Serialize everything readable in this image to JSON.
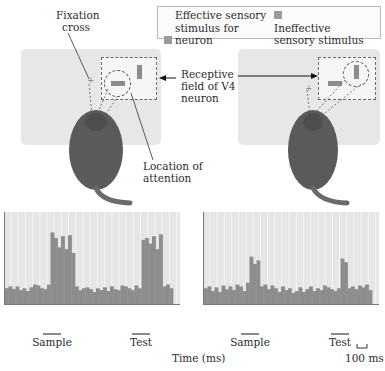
{
  "chart_data": [
    {
      "type": "bar",
      "title": "Attention directed to effective stimulus (in receptive field)",
      "xlabel": "Time (ms)",
      "ylabel": "",
      "scale_bar": "100 ms",
      "grid": true,
      "events": [
        "Sample",
        "Test"
      ],
      "bins": 48,
      "values": [
        18,
        20,
        17,
        20,
        16,
        18,
        15,
        19,
        22,
        21,
        18,
        17,
        22,
        78,
        72,
        62,
        74,
        60,
        75,
        56,
        20,
        16,
        18,
        19,
        17,
        14,
        18,
        16,
        19,
        15,
        20,
        17,
        16,
        21,
        20,
        18,
        16,
        21,
        18,
        70,
        72,
        66,
        74,
        60,
        76,
        20,
        22,
        18
      ]
    },
    {
      "type": "bar",
      "title": "Attention directed to ineffective stimulus (in receptive field)",
      "xlabel": "Time (ms)",
      "ylabel": "",
      "scale_bar": "100 ms",
      "grid": true,
      "events": [
        "Sample",
        "Test"
      ],
      "bins": 48,
      "values": [
        18,
        20,
        15,
        19,
        14,
        21,
        17,
        20,
        16,
        22,
        20,
        15,
        24,
        52,
        44,
        48,
        20,
        22,
        17,
        21,
        18,
        14,
        20,
        16,
        18,
        13,
        15,
        19,
        14,
        17,
        20,
        15,
        18,
        16,
        21,
        19,
        17,
        15,
        18,
        50,
        46,
        18,
        20,
        17,
        21,
        19,
        22,
        16
      ]
    }
  ],
  "annotations": {
    "fixation_cross": "Fixation cross",
    "receptive_field": "Receptive field of V4 neuron",
    "location_of_attention": "Location of attention"
  },
  "legend": {
    "effective": "Effective sensory stimulus for neuron",
    "ineffective": "Ineffective sensory stimulus for neuron",
    "effective_color": "#9a9a9a",
    "ineffective_color": "#9a9a9a"
  },
  "axis": {
    "xlabel": "Time (ms)",
    "scale_bar": "100 ms",
    "left_events": [
      "Sample",
      "Test"
    ],
    "right_events": [
      "Sample",
      "Test"
    ]
  },
  "colors": {
    "plot_bg": "#e6e6e6",
    "bar": "#8d8d8d",
    "screen": "#e7e7e7"
  }
}
